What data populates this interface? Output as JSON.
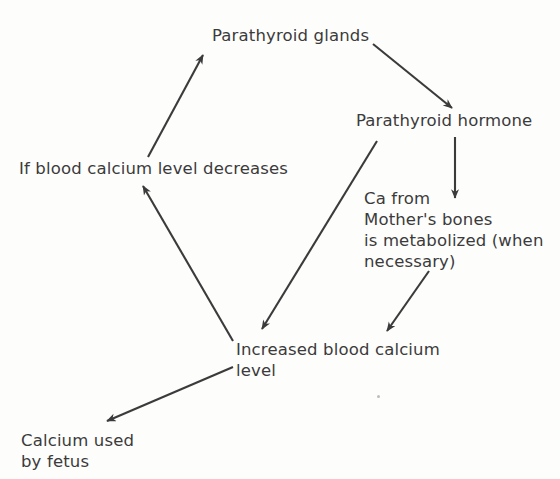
{
  "diagram": {
    "type": "flowchart-cycle",
    "background_color": "#fdfdfc",
    "ink_color": "#3b3b3b",
    "nodes": [
      {
        "id": "parathyroid-glands",
        "label": "Parathyroid glands",
        "x": 212,
        "y": 25
      },
      {
        "id": "parathyroid-hormone",
        "label": "Parathyroid hormone",
        "x": 356,
        "y": 110
      },
      {
        "id": "blood-calcium-decreases",
        "label": "If blood calcium level decreases",
        "x": 19,
        "y": 158
      },
      {
        "id": "ca-mother-bones",
        "label": "Ca from\nMother's bones\nis metabolized (when\nnecessary)",
        "x": 364,
        "y": 188
      },
      {
        "id": "increased-blood-calcium",
        "label": "Increased blood calcium\nlevel",
        "x": 236,
        "y": 339
      },
      {
        "id": "calcium-used-fetus",
        "label": "Calcium used\nby fetus",
        "x": 21,
        "y": 430
      }
    ],
    "arrows": [
      {
        "id": "glands-to-hormone",
        "from": "parathyroid-glands",
        "to": "parathyroid-hormone",
        "x1": 373,
        "y1": 44,
        "x2": 452,
        "y2": 108
      },
      {
        "id": "hormone-to-bones",
        "from": "parathyroid-hormone",
        "to": "ca-mother-bones",
        "x1": 455,
        "y1": 137,
        "x2": 455,
        "y2": 198
      },
      {
        "id": "hormone-to-increased-calcium",
        "from": "parathyroid-hormone",
        "to": "increased-blood-calcium",
        "x1": 377,
        "y1": 141,
        "x2": 262,
        "y2": 329
      },
      {
        "id": "bones-to-increased-calcium",
        "from": "ca-mother-bones",
        "to": "increased-blood-calcium",
        "x1": 429,
        "y1": 271,
        "x2": 387,
        "y2": 331
      },
      {
        "id": "increased-calcium-to-fetus",
        "from": "increased-blood-calcium",
        "to": "calcium-used-fetus",
        "x1": 233,
        "y1": 367,
        "x2": 107,
        "y2": 421
      },
      {
        "id": "increased-calcium-to-decreases",
        "from": "increased-blood-calcium",
        "to": "blood-calcium-decreases",
        "x1": 233,
        "y1": 341,
        "x2": 143,
        "y2": 186
      },
      {
        "id": "decreases-to-glands",
        "from": "blood-calcium-decreases",
        "to": "parathyroid-glands",
        "x1": 148,
        "y1": 157,
        "x2": 203,
        "y2": 55
      }
    ]
  }
}
